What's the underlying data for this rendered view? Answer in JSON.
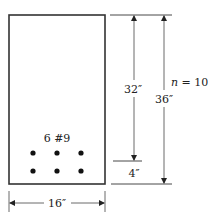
{
  "figure": {
    "reinforcement_label": "6 #9",
    "modular_ratio_label": "n = 10",
    "dimensions": {
      "effective_depth": "32″",
      "total_depth": "36″",
      "cover": "4″",
      "width": "16″"
    },
    "bars": {
      "count": 6,
      "rows": 2,
      "columns": 3
    },
    "colors": {
      "line": "#333333",
      "bar": "#111111",
      "background": "#ffffff"
    }
  }
}
